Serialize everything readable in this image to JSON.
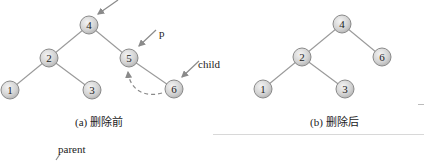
{
  "figure_a": {
    "caption": "(a) 删除前",
    "nodes": [
      {
        "id": "4",
        "x": 89,
        "y": 25
      },
      {
        "id": "2",
        "x": 49,
        "y": 58
      },
      {
        "id": "5",
        "x": 129,
        "y": 58
      },
      {
        "id": "1",
        "x": 10,
        "y": 90
      },
      {
        "id": "3",
        "x": 92,
        "y": 90
      },
      {
        "id": "6",
        "x": 174,
        "y": 89
      }
    ],
    "edges": [
      [
        "4",
        "2"
      ],
      [
        "4",
        "5"
      ],
      [
        "2",
        "1"
      ],
      [
        "2",
        "3"
      ],
      [
        "5",
        "6"
      ]
    ],
    "pointer_labels": {
      "p": "p",
      "child": "child"
    }
  },
  "figure_b": {
    "caption": "(b) 删除后",
    "nodes": [
      {
        "id": "4",
        "x": 342,
        "y": 24
      },
      {
        "id": "2",
        "x": 302,
        "y": 57
      },
      {
        "id": "6",
        "x": 382,
        "y": 57
      },
      {
        "id": "1",
        "x": 263,
        "y": 89
      },
      {
        "id": "3",
        "x": 345,
        "y": 89
      }
    ],
    "edges": [
      [
        "4",
        "2"
      ],
      [
        "4",
        "6"
      ],
      [
        "2",
        "1"
      ],
      [
        "2",
        "3"
      ]
    ]
  },
  "next_figure": {
    "label": "parent"
  }
}
